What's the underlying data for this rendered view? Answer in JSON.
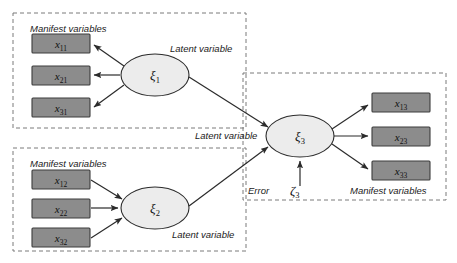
{
  "diagram": {
    "type": "structural-equation-model-path-diagram",
    "background_color": "#ffffff",
    "box_fill": "#8c8c8c",
    "box_stroke": "#3d3d3d",
    "ellipse_fill": "#ececec",
    "ellipse_stroke": "#2b2b2b",
    "dashed_stroke": "#7a7a7a",
    "arrow_stroke": "#2b2b2b"
  },
  "labels": {
    "manifest_top_left": "Manifest variables",
    "manifest_bottom_left": "Manifest variables",
    "manifest_right": "Manifest variables",
    "latent_xi1": "Latent variable",
    "latent_xi2": "Latent variable",
    "latent_xi3": "Latent variable",
    "latent_xi2_lower": "Latent variable",
    "error_label": "Error"
  },
  "blocks": [
    {
      "id": "block-1",
      "group_label": "Manifest variables",
      "latent_label": "Latent variable",
      "latent": {
        "symbol": "ξ",
        "subscript": "1"
      },
      "direction": "reflective",
      "indicators": [
        {
          "symbol": "x",
          "subscript": "11"
        },
        {
          "symbol": "x",
          "subscript": "21"
        },
        {
          "symbol": "x",
          "subscript": "31"
        }
      ]
    },
    {
      "id": "block-2",
      "group_label": "Manifest variables",
      "latent_label": "Latent variable",
      "latent": {
        "symbol": "ξ",
        "subscript": "2"
      },
      "direction": "formative",
      "indicators": [
        {
          "symbol": "x",
          "subscript": "12"
        },
        {
          "symbol": "x",
          "subscript": "22"
        },
        {
          "symbol": "x",
          "subscript": "32"
        }
      ]
    },
    {
      "id": "block-3",
      "group_label": "Manifest variables",
      "latent_label": "Latent variable",
      "latent": {
        "symbol": "ξ",
        "subscript": "3"
      },
      "direction": "reflective",
      "indicators": [
        {
          "symbol": "x",
          "subscript": "13"
        },
        {
          "symbol": "x",
          "subscript": "23"
        },
        {
          "symbol": "x",
          "subscript": "33"
        }
      ]
    }
  ],
  "error_term": {
    "label": "Error",
    "symbol": "ζ",
    "subscript": "3"
  },
  "structural_paths": [
    {
      "from": "ξ1",
      "to": "ξ3"
    },
    {
      "from": "ξ2",
      "to": "ξ3"
    },
    {
      "from": "ζ3",
      "to": "ξ3"
    }
  ]
}
